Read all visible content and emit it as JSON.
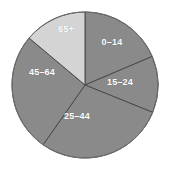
{
  "chart_data": {
    "type": "pie",
    "title": "",
    "subtitle": "",
    "xlabel": "",
    "ylabel": "",
    "legend_position": "none",
    "grid": false,
    "labels_inside_slices": true,
    "start_angle_deg": 0,
    "direction": "clockwise",
    "categories": [
      "0–14",
      "15–24",
      "25–44",
      "45–64",
      "65+"
    ],
    "values": [
      18.6,
      12.5,
      28.6,
      26.4,
      13.9
    ],
    "angles_deg": [
      67,
      45,
      103,
      95,
      50
    ],
    "colors": [
      "#8a8a8a",
      "#8a8a8a",
      "#8a8a8a",
      "#8a8a8a",
      "#d4d4d4"
    ],
    "slices": [
      {
        "label": "0–14",
        "value": 18.6,
        "angle_deg": 67,
        "start_deg": 0,
        "end_deg": 67,
        "color": "#8a8a8a",
        "label_color": "#ffffff",
        "label_x": 112,
        "label_y": 42
      },
      {
        "label": "15–24",
        "value": 12.5,
        "angle_deg": 45,
        "start_deg": 67,
        "end_deg": 112,
        "color": "#8a8a8a",
        "label_color": "#ffffff",
        "label_x": 120,
        "label_y": 82
      },
      {
        "label": "25–44",
        "value": 28.6,
        "angle_deg": 103,
        "start_deg": 112,
        "end_deg": 215,
        "color": "#8a8a8a",
        "label_color": "#ffffff",
        "label_x": 77,
        "label_y": 116
      },
      {
        "label": "45–64",
        "value": 26.4,
        "angle_deg": 95,
        "start_deg": 215,
        "end_deg": 310,
        "color": "#8a8a8a",
        "label_color": "#ffffff",
        "label_x": 42,
        "label_y": 72
      },
      {
        "label": "65+",
        "value": 13.9,
        "angle_deg": 50,
        "start_deg": 310,
        "end_deg": 360,
        "color": "#d4d4d4",
        "label_color": "#ffffff",
        "label_x": 66,
        "label_y": 29
      }
    ],
    "geometry": {
      "center_x": 85,
      "center_y": 85,
      "radius": 73
    },
    "style": {
      "background": "#ffffff",
      "divider_color": "#4a4a4a",
      "divider_width": 1,
      "outline_color": "#6f6f6f"
    }
  },
  "caption": {
    "text": ""
  }
}
